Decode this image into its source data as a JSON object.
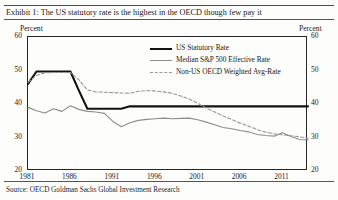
{
  "exhibit": {
    "title": "Exhibit 1: The US statutory rate is the highest in the OECD though few pay it",
    "source": "Source:  OECD Goldman Sachs Global Investment Research",
    "unit_left": "Percent",
    "unit_right": "Percent"
  },
  "legend": {
    "position": "inside-top-right",
    "items": [
      {
        "label": "US Statutory Rate",
        "color": "#121212",
        "style": "solid-thick"
      },
      {
        "label": "Median S&P 500 Effective Rate",
        "color": "#8d8d8d",
        "style": "solid-thin"
      },
      {
        "label": "Non-US OECD Weighted Avg-Rate",
        "color": "#9a9a9a",
        "style": "dashed"
      }
    ]
  },
  "chart_data": {
    "type": "line",
    "title": "Exhibit 1: The US statutory rate is the highest in the OECD though few pay it",
    "xlabel": "",
    "ylabel": "Percent",
    "ylim": [
      20,
      60
    ],
    "xlim": [
      1981,
      2014
    ],
    "yticks": [
      60,
      50,
      40,
      30,
      20
    ],
    "xticks": [
      1981,
      1986,
      1991,
      1996,
      2001,
      2006,
      2011
    ],
    "grid": false,
    "dual_axis": true,
    "x": [
      1981,
      1982,
      1983,
      1984,
      1985,
      1986,
      1987,
      1988,
      1989,
      1990,
      1991,
      1992,
      1993,
      1994,
      1995,
      1996,
      1997,
      1998,
      1999,
      2000,
      2001,
      2002,
      2003,
      2004,
      2005,
      2006,
      2007,
      2008,
      2009,
      2010,
      2011,
      2012,
      2013,
      2014
    ],
    "series": [
      {
        "name": "US Statutory Rate",
        "color": "#121212",
        "style": "solid-thick",
        "values": [
          46.0,
          49.7,
          49.7,
          49.7,
          49.7,
          49.7,
          44.0,
          38.6,
          38.6,
          38.6,
          38.6,
          38.6,
          39.3,
          39.3,
          39.3,
          39.3,
          39.3,
          39.3,
          39.3,
          39.3,
          39.3,
          39.3,
          39.3,
          39.3,
          39.3,
          39.3,
          39.3,
          39.3,
          39.3,
          39.3,
          39.3,
          39.3,
          39.3,
          39.3
        ]
      },
      {
        "name": "Median S&P 500 Effective Rate",
        "color": "#8d8d8d",
        "style": "solid-thin",
        "values": [
          39.0,
          38.0,
          37.3,
          38.6,
          37.8,
          39.5,
          38.4,
          37.8,
          37.6,
          37.2,
          34.8,
          33.2,
          34.4,
          35.1,
          35.4,
          35.6,
          35.8,
          35.6,
          35.7,
          35.8,
          35.3,
          34.6,
          33.8,
          33.0,
          32.6,
          32.1,
          31.7,
          30.9,
          30.6,
          30.4,
          31.4,
          30.3,
          29.4,
          29.3
        ]
      },
      {
        "name": "Non-US OECD Weighted Avg-Rate",
        "color": "#9a9a9a",
        "style": "dashed",
        "values": [
          46.5,
          48.5,
          49.3,
          49.4,
          49.4,
          49.4,
          47.2,
          44.2,
          43.6,
          43.5,
          43.4,
          43.3,
          43.2,
          43.8,
          44.0,
          43.9,
          43.6,
          43.2,
          42.4,
          41.5,
          40.2,
          38.8,
          37.6,
          36.4,
          35.4,
          34.3,
          33.4,
          32.4,
          31.6,
          31.1,
          30.8,
          30.5,
          30.2,
          29.8
        ]
      }
    ]
  }
}
